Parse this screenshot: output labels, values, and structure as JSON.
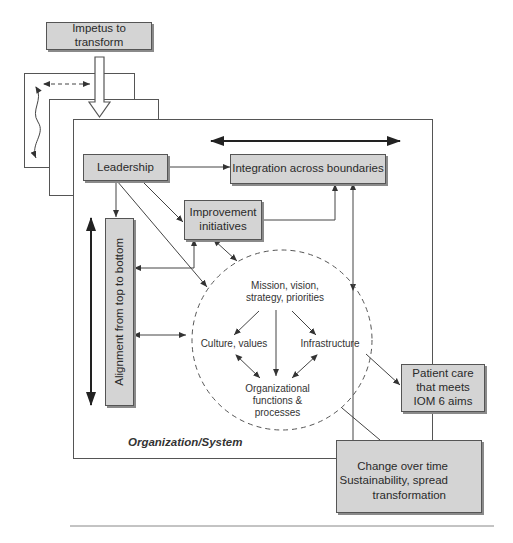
{
  "diagram": {
    "impetus": "Impetus to transform",
    "leadership": "Leadership",
    "integration": "Integration across boundaries",
    "improvement_line1": "Improvement",
    "improvement_line2": "initiatives",
    "alignment": "Alignment from top to bottom",
    "circle": {
      "mission_line1": "Mission, vision,",
      "mission_line2": "strategy, priorities",
      "culture": "Culture, values",
      "infrastructure": "Infrastructure",
      "functions_line1": "Organizational",
      "functions_line2": "functions &",
      "functions_line3": "processes"
    },
    "patient_line1": "Patient care",
    "patient_line2": "that meets",
    "patient_line3": "IOM 6 aims",
    "org_label": "Organization/System",
    "change_line1": "Change over time",
    "change_line2": "Sustainability, spread",
    "change_line3": "transformation"
  },
  "colors": {
    "box_fill": "#d4d4d4",
    "line": "#555555",
    "text": "#2a2a2a"
  }
}
